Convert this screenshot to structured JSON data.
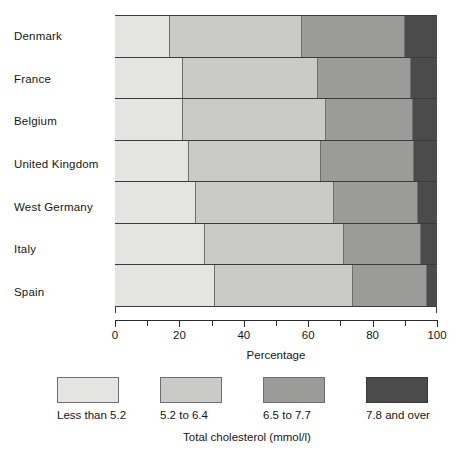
{
  "chart_data": {
    "type": "bar",
    "subtype": "stacked-horizontal-100",
    "title": "",
    "xlabel": "Percentage",
    "ylabel": "",
    "xlim": [
      0,
      100
    ],
    "xticks": [
      0,
      10,
      20,
      30,
      40,
      50,
      60,
      70,
      80,
      90,
      100
    ],
    "xtick_labels": [
      "0",
      "",
      "20",
      "",
      "40",
      "",
      "60",
      "",
      "80",
      "",
      "100"
    ],
    "grid": false,
    "legend_position": "bottom",
    "legend_title": "Total cholesterol (mmol/l)",
    "categories": [
      "Denmark",
      "France",
      "Belgium",
      "United Kingdom",
      "West Germany",
      "Italy",
      "Spain"
    ],
    "series": [
      {
        "name": "Less than 5.2",
        "color": "#e4e4e2",
        "values": [
          17,
          21,
          21,
          23,
          25,
          28,
          31
        ]
      },
      {
        "name": "5.2 to 6.4",
        "color": "#cacac8",
        "values": [
          41,
          42,
          44.5,
          41,
          43,
          43,
          43
        ]
      },
      {
        "name": "6.5 to 7.7",
        "color": "#9b9b99",
        "values": [
          32,
          29,
          27,
          29,
          26,
          24,
          23
        ]
      },
      {
        "name": "7.8 and over",
        "color": "#4b4b4b",
        "values": [
          10,
          8,
          7.5,
          7,
          6,
          5,
          3
        ]
      }
    ],
    "cumulative_boundaries": {
      "Denmark": [
        17,
        58,
        90
      ],
      "France": [
        21,
        63,
        92
      ],
      "Belgium": [
        21,
        65.5,
        93
      ],
      "United Kingdom": [
        23,
        64,
        93
      ],
      "West Germany": [
        25,
        68,
        94
      ],
      "Italy": [
        28,
        71,
        95
      ],
      "Spain": [
        31,
        74,
        97
      ]
    }
  },
  "axis": {
    "x_title": "Percentage",
    "tick_labels": [
      {
        "value": 0,
        "label": "0"
      },
      {
        "value": 20,
        "label": "20"
      },
      {
        "value": 40,
        "label": "40"
      },
      {
        "value": 60,
        "label": "60"
      },
      {
        "value": 80,
        "label": "80"
      },
      {
        "value": 100,
        "label": "100"
      }
    ]
  },
  "legend": {
    "title": "Total cholesterol (mmol/l)",
    "items": [
      {
        "label": "Less than 5.2",
        "color": "#e4e4e2"
      },
      {
        "label": "5.2 to 6.4",
        "color": "#cacac8"
      },
      {
        "label": "6.5 to 7.7",
        "color": "#9b9b99"
      },
      {
        "label": "7.8 and over",
        "color": "#4b4b4b"
      }
    ]
  }
}
